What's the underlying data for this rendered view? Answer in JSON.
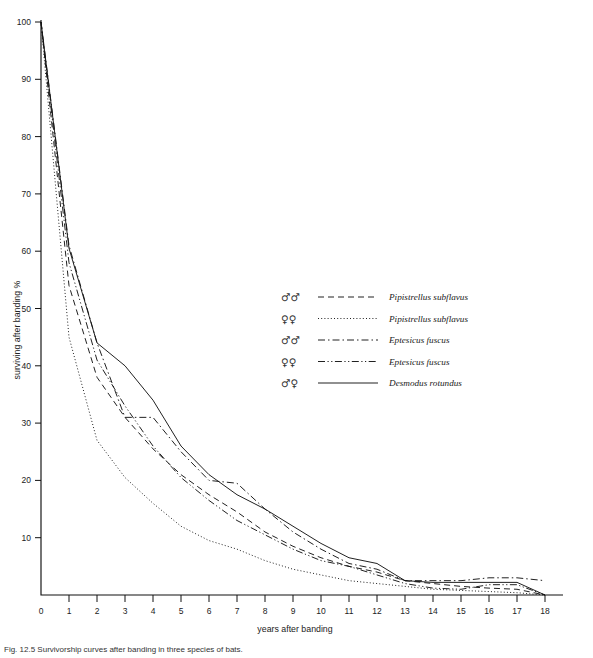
{
  "figure": {
    "caption": "Fig. 12.5  Survivorship curves after banding in three species of bats.",
    "caption_visible": "partially-cropped"
  },
  "chart_data": {
    "type": "line",
    "title": "",
    "xlabel": "years after banding",
    "ylabel": "surviving after banding %",
    "xlim": [
      0,
      18
    ],
    "ylim": [
      0,
      100
    ],
    "xticks": [
      "0",
      "1",
      "2",
      "3",
      "4",
      "5",
      "6",
      "7",
      "8",
      "9",
      "10",
      "11",
      "12",
      "13",
      "14",
      "15",
      "16",
      "17",
      "18"
    ],
    "yticks": [
      "10",
      "20",
      "30",
      "40",
      "50",
      "60",
      "70",
      "80",
      "90",
      "100"
    ],
    "grid": false,
    "legend_position": "center-right",
    "x": [
      0,
      1,
      2,
      3,
      4,
      5,
      6,
      7,
      8,
      9,
      10,
      11,
      12,
      13,
      14,
      15,
      16,
      17,
      18
    ],
    "series": [
      {
        "name": "Pipistrellus subflavus",
        "sex": "♂♂",
        "linestyle": "dashed",
        "dasharray": "6,4",
        "values": [
          100,
          54,
          38,
          31,
          25.5,
          21,
          17.5,
          14.5,
          11,
          8.5,
          6.5,
          5,
          4,
          2.5,
          2,
          1.5,
          1.2,
          1,
          0
        ]
      },
      {
        "name": "Pipistrellus subflavus",
        "sex": "♀♀",
        "linestyle": "dotted",
        "dasharray": "1,2.2",
        "values": [
          100,
          45,
          27,
          20.5,
          16,
          12,
          9.5,
          8,
          6,
          4.5,
          3.5,
          2.5,
          2,
          1.5,
          1,
          0.8,
          0.6,
          0.4,
          0
        ]
      },
      {
        "name": "Eptesicus fuscus",
        "sex": "♂♂",
        "linestyle": "dash-dot",
        "dasharray": "7,3,1.5,3",
        "values": [
          100,
          61,
          44,
          31,
          31,
          25,
          20,
          19.5,
          15,
          11,
          8,
          5.5,
          4.5,
          2.5,
          2.5,
          2.5,
          3,
          3,
          2.5
        ]
      },
      {
        "name": "Eptesicus fuscus",
        "sex": "♀♀",
        "linestyle": "dash-dot-dot",
        "dasharray": "7,2.5,1.2,2.5,1.2,2.5",
        "values": [
          100,
          58,
          41,
          33,
          26,
          20.5,
          16.5,
          13,
          10.5,
          8,
          6,
          5,
          3.5,
          2,
          1.2,
          1,
          1.8,
          1.8,
          0
        ]
      },
      {
        "name": "Desmodus rotundus",
        "sex": "♂♀",
        "linestyle": "solid",
        "dasharray": "",
        "values": [
          100,
          60.5,
          44,
          40,
          34,
          26,
          21,
          17.5,
          15,
          12,
          9,
          6.5,
          5.5,
          2.5,
          2.2,
          2.2,
          2.2,
          2.2,
          0
        ]
      }
    ]
  },
  "legend": {
    "entries": [
      {
        "sex": "♂♂",
        "label": "Pipistrellus subflavus"
      },
      {
        "sex": "♀♀",
        "label": "Pipistrellus subflavus"
      },
      {
        "sex": "♂♂",
        "label": "Eptesicus fuscus"
      },
      {
        "sex": "♀♀",
        "label": "Eptesicus fuscus"
      },
      {
        "sex": "♂♀",
        "label": "Desmodus rotundus"
      }
    ]
  },
  "colors": {
    "ink": "#151515",
    "background": "#ffffff"
  }
}
